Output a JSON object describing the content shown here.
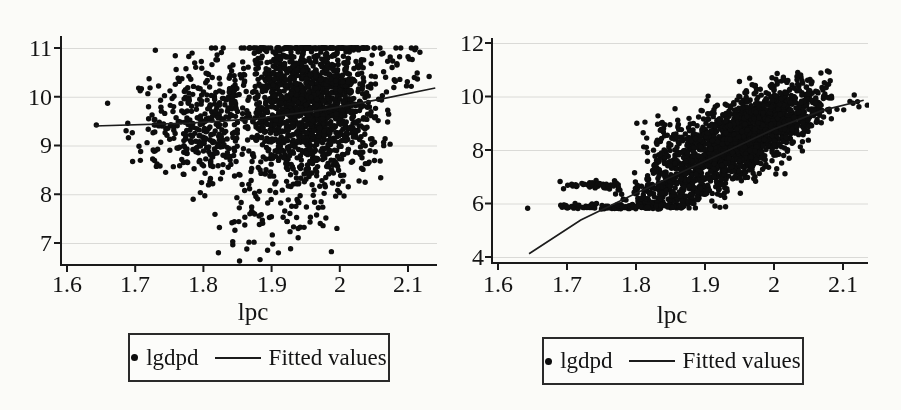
{
  "page": {
    "background": "#fbfbf8"
  },
  "chart_data": [
    {
      "type": "scatter",
      "title": "",
      "xlabel": "lpc",
      "ylabel": "",
      "xlim": [
        1.57,
        2.15
      ],
      "ylim": [
        6.55,
        11.25
      ],
      "xtick_labels": [
        "1.6",
        "1.7",
        "1.8",
        "1.9",
        "2",
        "2.1"
      ],
      "xtick_values": [
        1.6,
        1.7,
        1.8,
        1.9,
        2.0,
        2.1
      ],
      "ytick_labels": [
        "11",
        "10",
        "9",
        "8",
        "7"
      ],
      "ytick_values": [
        11,
        10,
        9,
        8,
        7
      ],
      "grid": "horizontal-only",
      "grid_color": "#dadad7",
      "axis_color": "#1a1a1a",
      "point_color": "#0d0d0d",
      "point_radius": 2.7,
      "line_color": "#1c1c1c",
      "legend": {
        "position": "below-center",
        "entries": [
          {
            "type": "marker",
            "label": "lgdpd"
          },
          {
            "type": "line",
            "label": "Fitted values"
          }
        ]
      },
      "series": [
        {
          "name": "lgdpd",
          "type": "scatter-dense",
          "censor_top": 11,
          "seed": 101,
          "clusters": [
            {
              "n": 1600,
              "cx": 1.955,
              "cy": 9.85,
              "sx": 0.05,
              "sy": 0.78,
              "corr": 0.0,
              "clip": [
                1.835,
                2.075,
                8.15,
                11.0
              ]
            },
            {
              "n": 300,
              "cx": 1.815,
              "cy": 9.55,
              "sx": 0.04,
              "sy": 0.6,
              "corr": 0.1,
              "clip": [
                1.72,
                1.85,
                8.2,
                11.0
              ]
            },
            {
              "n": 55,
              "cx": 1.745,
              "cy": 9.45,
              "sx": 0.038,
              "sy": 0.55,
              "corr": 0.0,
              "clip": [
                1.645,
                1.78,
                8.4,
                10.6
              ]
            },
            {
              "n": 110,
              "cx": 1.905,
              "cy": 7.85,
              "sx": 0.055,
              "sy": 0.6,
              "corr": 0.15,
              "clip": [
                1.77,
                2.02,
                6.6,
                8.6
              ]
            },
            {
              "n": 30,
              "cx": 2.09,
              "cy": 10.65,
              "sx": 0.027,
              "sy": 0.33,
              "corr": 0.2,
              "clip": [
                2.055,
                2.145,
                9.9,
                11.0
              ]
            }
          ],
          "points": [
            [
              1.643,
              9.42
            ],
            [
              1.822,
              6.8
            ],
            [
              1.853,
              6.63
            ]
          ]
        },
        {
          "name": "Fitted values",
          "type": "line",
          "points": [
            [
              1.64,
              9.4
            ],
            [
              1.78,
              9.46
            ],
            [
              1.88,
              9.55
            ],
            [
              1.98,
              9.74
            ],
            [
              2.06,
              9.95
            ],
            [
              2.14,
              10.18
            ]
          ]
        }
      ]
    },
    {
      "type": "scatter",
      "title": "",
      "xlabel": "lpc",
      "ylabel": "",
      "xlim": [
        1.57,
        2.15
      ],
      "ylim": [
        3.7,
        12.2
      ],
      "xtick_labels": [
        "1.6",
        "1.7",
        "1.8",
        "1.9",
        "2",
        "2.1"
      ],
      "xtick_values": [
        1.6,
        1.7,
        1.8,
        1.9,
        2.0,
        2.1
      ],
      "ytick_labels": [
        "12",
        "10",
        "8",
        "6",
        "4"
      ],
      "ytick_values": [
        12,
        10,
        8,
        6,
        4
      ],
      "grid": "horizontal-only",
      "grid_color": "#dadad7",
      "axis_color": "#1a1a1a",
      "point_color": "#0d0d0d",
      "point_radius": 2.7,
      "line_color": "#1c1c1c",
      "legend": {
        "position": "below-center",
        "entries": [
          {
            "type": "marker",
            "label": "lgdpd"
          },
          {
            "type": "line",
            "label": "Fitted values"
          }
        ]
      },
      "series": [
        {
          "name": "lgdpd",
          "type": "scatter-dense",
          "censor_top": null,
          "seed": 202,
          "clusters": [
            {
              "n": 1800,
              "cx": 1.952,
              "cy": 8.45,
              "sx": 0.062,
              "sy": 1.02,
              "corr": 0.72,
              "clip": [
                1.815,
                2.085,
                5.85,
                10.98
              ]
            },
            {
              "n": 200,
              "cx": 1.845,
              "cy": 6.35,
              "sx": 0.045,
              "sy": 0.42,
              "corr": 0.45,
              "clip": [
                1.765,
                1.93,
                5.8,
                7.5
              ]
            },
            {
              "n": 120,
              "cx": 1.7825,
              "cy": 5.87,
              "sx": 0.0925,
              "sy": 0.055,
              "corr": 0.0,
              "uniform_x": true,
              "clip": [
                1.69,
                1.875,
                5.79,
                6.05
              ]
            },
            {
              "n": 40,
              "cx": 1.735,
              "cy": 6.68,
              "sx": 0.028,
              "sy": 0.1,
              "corr": 0.0,
              "clip": [
                1.688,
                1.8,
                6.45,
                6.95
              ]
            },
            {
              "n": 25,
              "cx": 1.835,
              "cy": 8.55,
              "sx": 0.022,
              "sy": 0.35,
              "corr": 0.0,
              "clip": [
                1.798,
                1.875,
                7.9,
                9.3
              ]
            },
            {
              "n": 9,
              "cx": 2.11,
              "cy": 9.65,
              "sx": 0.022,
              "sy": 0.28,
              "corr": 0.3,
              "clip": [
                2.078,
                2.145,
                9.3,
                10.25
              ]
            }
          ],
          "points": [
            [
              1.643,
              5.82
            ],
            [
              1.69,
              6.82
            ],
            [
              1.695,
              6.55
            ],
            [
              2.055,
              10.55
            ]
          ]
        },
        {
          "name": "Fitted values",
          "type": "line",
          "points": [
            [
              1.645,
              4.12
            ],
            [
              1.72,
              5.38
            ],
            [
              1.8,
              6.38
            ],
            [
              1.9,
              7.58
            ],
            [
              2.0,
              8.78
            ],
            [
              2.07,
              9.48
            ],
            [
              2.13,
              9.86
            ]
          ]
        }
      ]
    }
  ]
}
